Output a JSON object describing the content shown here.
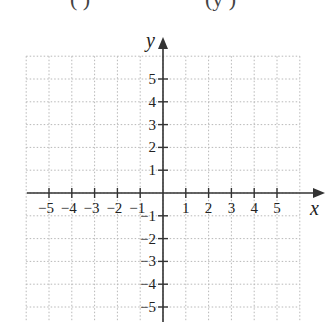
{
  "header": {
    "equation_fragment_left": "(          )",
    "equation_fragment_right": "(y          )"
  },
  "chart_data": {
    "type": "scatter",
    "title": "",
    "xlabel": "x",
    "ylabel": "y",
    "xlim": [
      -6,
      6
    ],
    "ylim": [
      -5,
      6
    ],
    "x_ticks": [
      -5,
      -4,
      -3,
      -2,
      -1,
      1,
      2,
      3,
      4,
      5
    ],
    "y_ticks": [
      -5,
      -4,
      -3,
      -2,
      -1,
      1,
      2,
      3,
      4,
      5
    ],
    "x_tick_labels": [
      "−5",
      "−4",
      "−3",
      "−2",
      "−1",
      "1",
      "2",
      "3",
      "4",
      "5"
    ],
    "y_tick_labels": [
      "−5",
      "−4",
      "−3",
      "−2",
      "−1",
      "1",
      "2",
      "3",
      "4",
      "5"
    ],
    "grid": true,
    "grid_style": "dotted",
    "points": [],
    "series": []
  },
  "colors": {
    "axis": "#333333",
    "grid": "#b8b8b8",
    "text": "#222222"
  }
}
